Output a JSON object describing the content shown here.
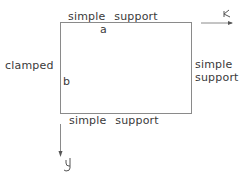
{
  "diagram": {
    "type": "plate-boundary-conditions",
    "edges": {
      "top": "simple support",
      "bottom": "simple support",
      "left": "clamped",
      "right_line1": "simple",
      "right_line2": "support"
    },
    "dimensions": {
      "width_label": "a",
      "height_label": "b"
    },
    "axes": {
      "x_label": "x",
      "y_label": "y"
    },
    "colors": {
      "line": "#888888",
      "text": "#3a3a3a"
    }
  }
}
